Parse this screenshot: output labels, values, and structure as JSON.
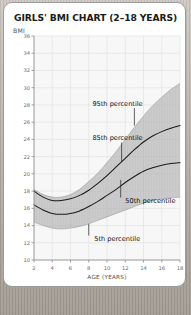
{
  "card": {
    "title": "GIRLS' BMI CHART (2–18 YEARS)"
  },
  "chart_data": {
    "type": "line",
    "title": "GIRLS' BMI CHART (2–18 YEARS)",
    "xlabel": "AGE (YEARS)",
    "ylabel": "BMI",
    "xlim": [
      2,
      18
    ],
    "ylim": [
      10,
      36
    ],
    "xticks": [
      2,
      4,
      6,
      8,
      10,
      12,
      14,
      16,
      18
    ],
    "yticks": [
      10,
      12,
      14,
      16,
      18,
      20,
      22,
      24,
      26,
      28,
      30,
      32,
      34,
      36
    ],
    "grid": true,
    "legend_position": "inline-annotations",
    "band_fill_color": "#a8a8a8",
    "curve_color": "#1a1a1a",
    "plot_bg_color": "#f7f7f7",
    "grid_color": "#e2e2e2",
    "x": [
      2,
      3,
      4,
      5,
      6,
      7,
      8,
      9,
      10,
      11,
      12,
      13,
      14,
      15,
      16,
      17,
      18
    ],
    "series": [
      {
        "name": "95th percentile",
        "style": "band-upper-edge",
        "values": [
          18.2,
          17.6,
          17.3,
          17.3,
          17.6,
          18.2,
          19.1,
          20.1,
          21.3,
          22.6,
          24.0,
          25.4,
          26.7,
          27.9,
          28.9,
          29.8,
          30.5
        ]
      },
      {
        "name": "85th percentile",
        "style": "solid-curve",
        "values": [
          18.0,
          17.3,
          16.9,
          16.9,
          17.1,
          17.5,
          18.1,
          18.9,
          19.8,
          20.8,
          21.8,
          22.8,
          23.7,
          24.4,
          24.9,
          25.3,
          25.6
        ]
      },
      {
        "name": "50th percentile",
        "style": "solid-curve",
        "values": [
          16.4,
          15.8,
          15.4,
          15.3,
          15.4,
          15.7,
          16.2,
          16.8,
          17.5,
          18.2,
          19.0,
          19.7,
          20.3,
          20.7,
          21.0,
          21.2,
          21.3
        ]
      },
      {
        "name": "5th percentile",
        "style": "band-lower-edge",
        "values": [
          14.4,
          14.0,
          13.7,
          13.6,
          13.7,
          13.9,
          14.2,
          14.6,
          15.0,
          15.4,
          15.8,
          16.2,
          16.6,
          16.9,
          17.1,
          17.2,
          17.3
        ]
      }
    ],
    "annotations": [
      {
        "id": "ann-95",
        "label": "95th percentile",
        "text_x": 8.4,
        "text_y": 27.9,
        "leader_to_x": 13.0,
        "leader_to_y": 25.6
      },
      {
        "id": "ann-85",
        "label": "85th percentile",
        "text_x": 8.4,
        "text_y": 23.9,
        "leader_to_x": 11.6,
        "leader_to_y": 21.4
      },
      {
        "id": "ann-50",
        "label": "50th percentile",
        "text_x": 12.0,
        "text_y": 16.6,
        "leader_to_x": 11.5,
        "leader_to_y": 19.3
      },
      {
        "id": "ann-5",
        "label": "5th percentile",
        "text_x": 8.6,
        "text_y": 12.2,
        "leader_to_x": 8.0,
        "leader_to_y": 14.2
      }
    ]
  }
}
